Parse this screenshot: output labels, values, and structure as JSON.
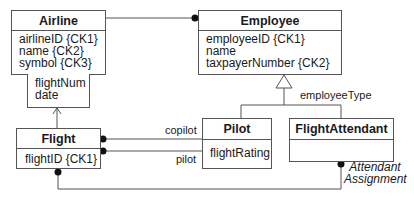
{
  "classes": {
    "airline": {
      "name": "Airline",
      "attributes": [
        "airlineID {CK1}",
        "name {CK2}",
        "symbol {CK3}"
      ]
    },
    "airline_qualifier": {
      "attributes": [
        "flightNum",
        "date"
      ]
    },
    "employee": {
      "name": "Employee",
      "attributes": [
        "employeeID {CK1}",
        "name",
        "taxpayerNumber {CK2}"
      ]
    },
    "flight": {
      "name": "Flight",
      "attributes": [
        "flightID {CK1}"
      ]
    },
    "pilot": {
      "name": "Pilot",
      "attributes": [
        "flightRating"
      ]
    },
    "flight_attendant": {
      "name": "FlightAttendant",
      "attributes": []
    }
  },
  "labels": {
    "discriminator": "employeeType",
    "copilot_role": "copilot",
    "pilot_role": "pilot",
    "association_line1": "Attendant",
    "association_line2": "Assignment"
  },
  "colors": {
    "line": "#555555",
    "text": "#1a1a1a",
    "background": "#ffffff"
  }
}
